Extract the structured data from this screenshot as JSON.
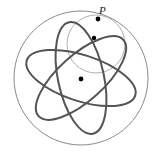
{
  "figure": {
    "type": "geometric-diagram",
    "canvas": {
      "width": 163,
      "height": 156,
      "background": "#ffffff"
    },
    "colors": {
      "outer_circle_stroke": "#8a8a8a",
      "small_circle_stroke": "#b0b0b0",
      "ellipse_stroke": "#545454",
      "dot_fill": "#000000",
      "label_color": "#1a1a1a"
    },
    "labels": {
      "point_p": "P"
    },
    "outer_circle": {
      "cx": 81,
      "cy": 78,
      "r": 67,
      "stroke_width": 1
    },
    "small_circle": {
      "cx": 96,
      "cy": 44,
      "r": 29,
      "stroke_width": 1
    },
    "ellipses": [
      {
        "cx": 81,
        "cy": 78,
        "rx": 57,
        "ry": 23,
        "rotation": 18
      },
      {
        "cx": 81,
        "cy": 78,
        "rx": 57,
        "ry": 23,
        "rotation": 138
      },
      {
        "cx": 81,
        "cy": 78,
        "rx": 57,
        "ry": 23,
        "rotation": 258
      }
    ],
    "dots": [
      {
        "name": "point-p-dot",
        "cx": 98,
        "cy": 19,
        "r": 2.4
      },
      {
        "name": "upper-dot",
        "cx": 94,
        "cy": 38,
        "r": 2.2
      },
      {
        "name": "center-dot",
        "cx": 81,
        "cy": 79,
        "r": 2.4
      }
    ],
    "label_position": {
      "x": 99,
      "y": 5
    }
  }
}
